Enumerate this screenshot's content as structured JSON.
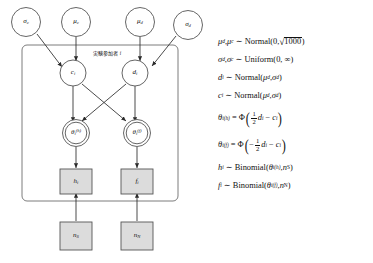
{
  "diagram": {
    "plate_label": "実験参加者 ",
    "plate_label_index": "i",
    "nodes": {
      "sigma_c": "σ",
      "sigma_c_sub": "c",
      "mu_c": "μ",
      "mu_c_sub": "c",
      "mu_d": "μ",
      "mu_d_sub": "d",
      "sigma_d": "σ",
      "sigma_d_sub": "d",
      "c_i": "c",
      "c_i_sub": "i",
      "d_i": "d",
      "d_i_sub": "i",
      "theta_h": "θ",
      "theta_h_sub": "i",
      "theta_h_sup": "(h)",
      "theta_f": "θ",
      "theta_f_sub": "i",
      "theta_f_sup": "(f)",
      "h_i": "h",
      "h_i_sub": "i",
      "f_i": "f",
      "f_i_sub": "i",
      "n_S": "n",
      "n_S_sub": "S",
      "n_N": "n",
      "n_N_sub": "N"
    }
  },
  "equations": {
    "eq1": {
      "lhs_mu_d": "μ",
      "lhs_mu_d_sub": "d",
      "comma": ", ",
      "lhs_mu_c": "μ",
      "lhs_mu_c_sub": "c",
      "tilde": "∼",
      "dist": "Normal(0, ",
      "radicand": "1000",
      "close": ")"
    },
    "eq2": {
      "lhs_sigma_d": "σ",
      "lhs_sigma_d_sub": "d",
      "comma": ", ",
      "lhs_sigma_c": "σ",
      "lhs_sigma_c_sub": "c",
      "tilde": "∼",
      "dist": "Uniform(0, ∞)"
    },
    "eq3": {
      "lhs": "d",
      "lhs_sub": "i",
      "tilde": "∼",
      "dist_open": "Normal(",
      "p1": "μ",
      "p1_sub": "d",
      "sep": ", ",
      "p2": "σ",
      "p2_sub": "d",
      "close": ")"
    },
    "eq4": {
      "lhs": "c",
      "lhs_sub": "i",
      "tilde": "∼",
      "dist_open": "Normal(",
      "p1": "μ",
      "p1_sub": "d",
      "sep": ", ",
      "p2": "σ",
      "p2_sub": "d",
      "close": ")"
    },
    "eq5": {
      "lhs": "θ",
      "lhs_sub": "i",
      "lhs_sup": "(h)",
      "eq": "=",
      "phi": "Φ",
      "num": "1",
      "den": "2",
      "var1": "d",
      "var1_sub": "i",
      "minus": "−",
      "var2": "c",
      "var2_sub": "i"
    },
    "eq6": {
      "lhs": "θ",
      "lhs_sub": "i",
      "lhs_sup": "(f)",
      "eq": "=",
      "phi": "Φ",
      "sign": "−",
      "num": "1",
      "den": "2",
      "var1": "d",
      "var1_sub": "i",
      "minus": "−",
      "var2": "c",
      "var2_sub": "i"
    },
    "eq7": {
      "lhs": "h",
      "lhs_sub": "i",
      "tilde": "∼",
      "dist_open": "Binomial(",
      "p1": "θ",
      "p1_sub": "i",
      "p1_sup": "(h)",
      "sep": ", ",
      "p2": "n",
      "p2_sub": "S",
      "close": ")"
    },
    "eq8": {
      "lhs": "f",
      "lhs_sub": "i",
      "tilde": "∼",
      "dist_open": "Binomial(",
      "p1": "θ",
      "p1_sub": "i",
      "p1_sup": "(f)",
      "sep": ", ",
      "p2": "n",
      "p2_sub": "N",
      "close": ")"
    }
  },
  "colors": {
    "stroke": "#3a3a3a",
    "observed_fill": "#d8d8d8",
    "latent_fill": "#ffffff",
    "text": "#111111"
  }
}
